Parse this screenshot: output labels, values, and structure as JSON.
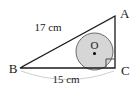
{
  "figure": {
    "type": "geometry-diagram",
    "vertices": [
      {
        "name": "A",
        "label": "A",
        "x": 115,
        "y": 16
      },
      {
        "name": "B",
        "label": "B",
        "x": 20,
        "y": 68
      },
      {
        "name": "C",
        "label": "C",
        "x": 115,
        "y": 68
      }
    ],
    "center_label": "O",
    "right_angle_at": "C",
    "dimensions": [
      {
        "name": "hypotenuse-ab",
        "label": "17 cm",
        "value": 17,
        "unit": "cm",
        "side": "AB"
      },
      {
        "name": "base-bc",
        "label": "15 cm",
        "value": 15,
        "unit": "cm",
        "side": "BC"
      }
    ],
    "incircle": {
      "cx": 94.5,
      "cy": 51.5,
      "r": 18.5
    },
    "colors": {
      "stroke": "#1a1a1a",
      "circle_fill": "#d6d6d6",
      "circle_stroke": "#555555",
      "dimension_arc": "#c9c9c9",
      "background": "#ffffff",
      "center_dot": "#000000"
    }
  }
}
